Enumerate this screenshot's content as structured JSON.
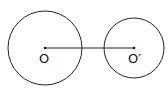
{
  "diagram": {
    "circles": [
      {
        "name": "circle-o",
        "cx": 45,
        "cy": 48,
        "r": 37,
        "center_label": "O"
      },
      {
        "name": "circle-o-prime",
        "cx": 134,
        "cy": 48,
        "r": 30,
        "center_label": "O′"
      }
    ],
    "segment": {
      "from": "O",
      "to": "O′"
    },
    "colors": {
      "stroke": "#222222",
      "background": "#ffffff"
    }
  }
}
